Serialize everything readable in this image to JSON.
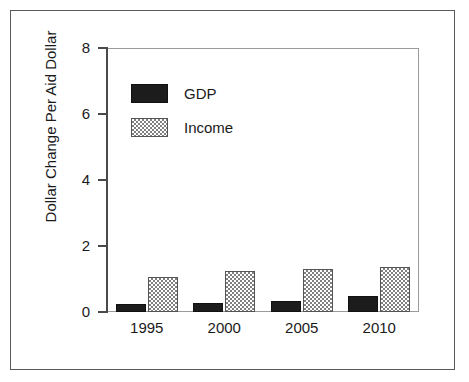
{
  "chart_data": {
    "type": "bar",
    "title": "",
    "xlabel": "",
    "ylabel": "Dollar Change Per Aid Dollar",
    "categories": [
      "1995",
      "2000",
      "2005",
      "2010"
    ],
    "series": [
      {
        "name": "GDP",
        "values": [
          0.24,
          0.27,
          0.32,
          0.48
        ],
        "color": "#1c1c1c",
        "fill": "solid-black"
      },
      {
        "name": "Income",
        "values": [
          1.06,
          1.24,
          1.3,
          1.36
        ],
        "color": "#808080",
        "fill": "checkerboard-gray"
      }
    ],
    "ylim": [
      0,
      8
    ],
    "yticks": [
      "0",
      "2",
      "4",
      "6",
      "8"
    ],
    "ytick_values": [
      0,
      2,
      4,
      6,
      8
    ],
    "grid": false,
    "legend_position": "upper-left-inside",
    "legend": [
      "GDP",
      "Income"
    ]
  },
  "figure": {
    "border_color": "#5a5a5a",
    "background": "#ffffff",
    "axis_color": "#4a4a4a"
  }
}
